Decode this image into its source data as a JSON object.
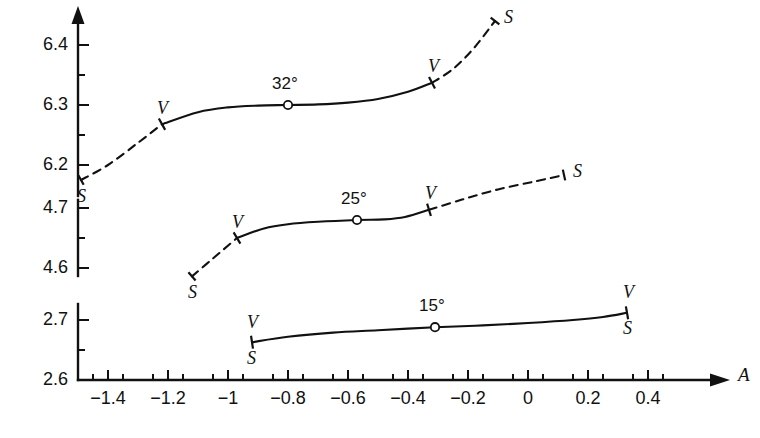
{
  "chart_data": {
    "type": "line",
    "title": "",
    "xlabel": "A",
    "ylabel": "",
    "xlim": [
      -1.5,
      0.55
    ],
    "grid": false,
    "legend": "none",
    "x_ticks": [
      "-1.4",
      "-1.2",
      "-1",
      "-0.8",
      "-0.6",
      "-0.4",
      "-0.2",
      "0",
      "0.2",
      "0.4"
    ],
    "x_tick_values": [
      -1.4,
      -1.2,
      -1.0,
      -0.8,
      -0.6,
      -0.4,
      -0.2,
      0.0,
      0.2,
      0.4
    ],
    "x_minor_step": 0.1,
    "y_axis_broken": true,
    "y_segments": [
      {
        "ticks": [
          "6.4",
          "6.3",
          "6.2"
        ],
        "values": [
          6.4,
          6.3,
          6.2
        ],
        "minor_step": 0.05
      },
      {
        "ticks": [
          "4.7",
          "4.6"
        ],
        "values": [
          4.7,
          4.6
        ],
        "minor_step": 0.05
      },
      {
        "ticks": [
          "2.7",
          "2.6"
        ],
        "values": [
          2.7,
          2.6
        ],
        "minor_step": 0.05
      }
    ],
    "series": [
      {
        "name": "32",
        "label": "32°",
        "marker_point": {
          "x": -0.8,
          "y": 6.3
        },
        "solid_range": [
          -1.22,
          -0.32
        ],
        "dashed_left_range": [
          -1.49,
          -1.22
        ],
        "dashed_right_range": [
          -0.32,
          -0.11
        ],
        "points": [
          {
            "x": -1.49,
            "y": 6.175
          },
          {
            "x": -1.4,
            "y": 6.2
          },
          {
            "x": -1.3,
            "y": 6.237
          },
          {
            "x": -1.22,
            "y": 6.268
          },
          {
            "x": -1.1,
            "y": 6.288
          },
          {
            "x": -1.0,
            "y": 6.296
          },
          {
            "x": -0.9,
            "y": 6.299
          },
          {
            "x": -0.8,
            "y": 6.3
          },
          {
            "x": -0.7,
            "y": 6.301
          },
          {
            "x": -0.6,
            "y": 6.304
          },
          {
            "x": -0.5,
            "y": 6.31
          },
          {
            "x": -0.4,
            "y": 6.322
          },
          {
            "x": -0.32,
            "y": 6.337
          },
          {
            "x": -0.25,
            "y": 6.36
          },
          {
            "x": -0.18,
            "y": 6.395
          },
          {
            "x": -0.11,
            "y": 6.44
          }
        ],
        "end_labels": {
          "left_inner": "V",
          "right_inner": "V",
          "left_outer": "S",
          "right_outer": "S"
        }
      },
      {
        "name": "25",
        "label": "25°",
        "marker_point": {
          "x": -0.57,
          "y": 4.68
        },
        "solid_range": [
          -0.97,
          -0.33
        ],
        "dashed_left_range": [
          -1.12,
          -0.97
        ],
        "dashed_right_range": [
          -0.33,
          0.12
        ],
        "points": [
          {
            "x": -1.12,
            "y": 4.586
          },
          {
            "x": -1.05,
            "y": 4.616
          },
          {
            "x": -0.97,
            "y": 4.65
          },
          {
            "x": -0.88,
            "y": 4.666
          },
          {
            "x": -0.8,
            "y": 4.673
          },
          {
            "x": -0.7,
            "y": 4.677
          },
          {
            "x": -0.57,
            "y": 4.68
          },
          {
            "x": -0.48,
            "y": 4.681
          },
          {
            "x": -0.41,
            "y": 4.685
          },
          {
            "x": -0.33,
            "y": 4.697
          },
          {
            "x": -0.22,
            "y": 4.714
          },
          {
            "x": -0.1,
            "y": 4.731
          },
          {
            "x": 0.02,
            "y": 4.744
          },
          {
            "x": 0.12,
            "y": 4.755
          }
        ],
        "end_labels": {
          "left_inner": "V",
          "right_inner": "V",
          "left_outer": "S",
          "right_outer": "S"
        }
      },
      {
        "name": "15",
        "label": "15°",
        "marker_point": {
          "x": -0.31,
          "y": 2.688
        },
        "solid_range": [
          -0.92,
          0.33
        ],
        "dashed_left_range": null,
        "dashed_right_range": null,
        "points": [
          {
            "x": -0.92,
            "y": 2.663
          },
          {
            "x": -0.8,
            "y": 2.672
          },
          {
            "x": -0.65,
            "y": 2.679
          },
          {
            "x": -0.5,
            "y": 2.683
          },
          {
            "x": -0.31,
            "y": 2.688
          },
          {
            "x": -0.15,
            "y": 2.691
          },
          {
            "x": 0.0,
            "y": 2.695
          },
          {
            "x": 0.15,
            "y": 2.7
          },
          {
            "x": 0.25,
            "y": 2.705
          },
          {
            "x": 0.33,
            "y": 2.712
          }
        ],
        "end_labels": {
          "left_inner": "V",
          "right_inner": "V",
          "left_outer": "S",
          "right_outer": "S"
        }
      }
    ],
    "annotations": [
      {
        "text": "32°",
        "x": -0.8,
        "near": "top-curve-marker"
      },
      {
        "text": "25°",
        "x": -0.57,
        "near": "middle-curve-marker"
      },
      {
        "text": "15°",
        "x": -0.31,
        "near": "bottom-curve-marker"
      },
      {
        "text": "V",
        "meaning": "vapour-boundary-tick"
      },
      {
        "text": "S",
        "meaning": "solid-boundary-endpoint"
      },
      {
        "text": "A",
        "meaning": "x-axis-name"
      }
    ]
  },
  "axis": {
    "x_name": "A",
    "x_tick_labels": [
      "-1.4",
      "-1.2",
      "-1",
      "-0.8",
      "-0.6",
      "-0.4",
      "-0.2",
      "0",
      "0.2",
      "0.4"
    ],
    "y_tick_labels": [
      "6.4",
      "6.3",
      "6.2",
      "4.7",
      "4.6",
      "2.7",
      "2.6"
    ]
  },
  "marks": {
    "top": {
      "degree": "32°",
      "v_left": "V",
      "v_right": "V",
      "s_left": "S",
      "s_right": "S"
    },
    "middle": {
      "degree": "25°",
      "v_left": "V",
      "v_right": "V",
      "s_left": "S",
      "s_right": "S"
    },
    "bottom": {
      "degree": "15°",
      "v_left": "V",
      "v_right": "V",
      "s_left": "S",
      "s_right": "S"
    }
  },
  "colors": {
    "ink": "#111111",
    "background": "#ffffff"
  }
}
